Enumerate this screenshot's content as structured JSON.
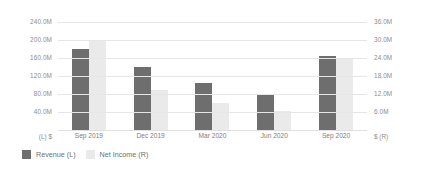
{
  "chart_data": {
    "type": "bar",
    "title": "",
    "subtitle": "",
    "xlabel": "",
    "categories": [
      "Sep 2019",
      "Dec 2019",
      "Mar 2020",
      "Jun 2020",
      "Sep 2020"
    ],
    "series": [
      {
        "name": "Revenue (L)",
        "axis": "left",
        "color": "#6e6e6e",
        "values": [
          180000000,
          140000000,
          105000000,
          80000000,
          165000000
        ],
        "value_labels": [
          "180.0M",
          "140.0M",
          "105.0M",
          "80.0M",
          "165.0M"
        ]
      },
      {
        "name": "Net Income (R)",
        "axis": "right",
        "color": "#eaeaea",
        "values": [
          30000000,
          13500000,
          9000000,
          6500000,
          24000000
        ],
        "value_labels": [
          "30.0M",
          "13.5M",
          "9.0M",
          "6.5M",
          "24.0M"
        ]
      }
    ],
    "left_axis": {
      "label": "(L)  $",
      "unit": "$",
      "side": "L",
      "ylim": [
        0,
        240000000
      ],
      "ticks": [
        240000000,
        200000000,
        160000000,
        120000000,
        80000000,
        40000000
      ],
      "tick_labels": [
        "240.0M",
        "200.0M",
        "160.0M",
        "120.0M",
        "80.0M",
        "40.0M"
      ]
    },
    "right_axis": {
      "label": "$  (R)",
      "unit": "$",
      "side": "R",
      "ylim": [
        0,
        36000000
      ],
      "ticks": [
        36000000,
        30000000,
        24000000,
        18000000,
        12000000,
        6000000
      ],
      "tick_labels": [
        "36.0M",
        "30.0M",
        "24.0M",
        "18.0M",
        "12.0M",
        "6.0M"
      ]
    },
    "grid": true,
    "legend_position": "bottom-left",
    "legend": [
      "Revenue (L)",
      "Net Income (R)"
    ],
    "colors": {
      "revenue": "#6e6e6e",
      "net_income": "#eaeaea",
      "gridline": "#e6e6e6",
      "tick_text": "#8c8c8c",
      "background": "#ffffff"
    }
  }
}
